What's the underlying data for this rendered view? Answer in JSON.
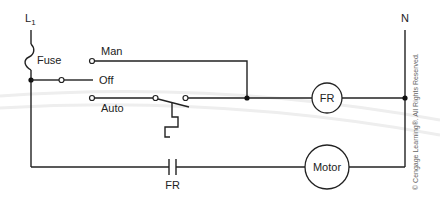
{
  "diagram": {
    "rails": {
      "left_label": "L",
      "left_subscript": "1",
      "right_label": "N"
    },
    "fuse_label": "Fuse",
    "selector_switch": {
      "positions": [
        "Man",
        "Off",
        "Auto"
      ]
    },
    "rung1": {
      "coil_label": "FR"
    },
    "rung2": {
      "contact_label": "FR",
      "load_label": "Motor"
    },
    "copyright": "© Cengage Learning®. All Rights Reserved."
  }
}
